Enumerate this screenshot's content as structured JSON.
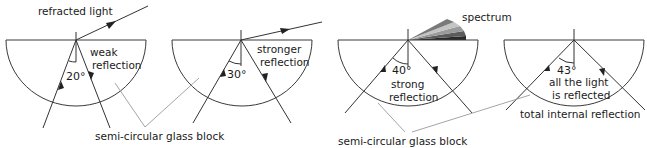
{
  "labels": {
    "refracted_light": "refracted light",
    "spectrum": "spectrum",
    "block_label_left": "semi-circular glass block",
    "block_label_right": "semi-circular glass block",
    "total_internal_reflection": "total internal reflection"
  },
  "panels": [
    {
      "angle": "20°",
      "caption_line1": "weak",
      "caption_line2": "reflection"
    },
    {
      "angle": "30°",
      "caption_line1": "stronger",
      "caption_line2": "reflection"
    },
    {
      "angle": "40°",
      "caption_line1": "strong",
      "caption_line2": "reflection"
    },
    {
      "angle": "43°",
      "caption_line1": "all the light",
      "caption_line2": "is reflected"
    }
  ],
  "colors": {
    "line": "#333333",
    "pointer": "#9a9a9a",
    "spectrum_bands": [
      "#2b2b2b",
      "#6a6a6a",
      "#b5b5b5",
      "#7a7a7a",
      "#4a4a4a"
    ]
  }
}
